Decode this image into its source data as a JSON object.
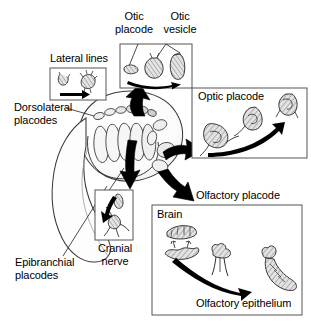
{
  "figure": {
    "background_color": "#ffffff",
    "stroke_color": "#000000",
    "arrow_color": "#000000",
    "panel_border_color": "#555555",
    "hatch_fill_color": "#d9d9d9"
  },
  "labels": {
    "otic_placode": "Otic\nplacode",
    "otic_vesicle": "Otic\nvesicle",
    "lateral_lines": "Lateral lines",
    "dorsolateral_placodes": "Dorsolateral\nplacodes",
    "epibranchial_placodes": "Epibranchial\nplacodes",
    "optic_placode": "Optic placode",
    "olfactory_placode": "Olfactory placode",
    "brain": "Brain",
    "olfactory_epithelium": "Olfactory epithelium",
    "cranial_nerve": "Cranial\nnerve"
  },
  "panels": [
    {
      "id": "lateral-lines-panel",
      "label": "Lateral lines",
      "label_position": "above",
      "x": 50,
      "y": 68,
      "width": 56,
      "height": 32,
      "stage_count": 2,
      "arrow": "straight-right"
    },
    {
      "id": "otic-panel",
      "label": "Otic placode / Otic vesicle",
      "label_position": "above",
      "x": 120,
      "y": 44,
      "width": 72,
      "height": 44,
      "stage_count": 3,
      "arrow": "curved-right"
    },
    {
      "id": "optic-panel",
      "label": "Optic placode",
      "label_position": "inside-top-left",
      "x": 192,
      "y": 88,
      "width": 115,
      "height": 70,
      "stage_count": 3,
      "arrow": "curved-up-right"
    },
    {
      "id": "cranial-nerve-panel",
      "label": "Cranial nerve",
      "label_position": "below",
      "x": 95,
      "y": 190,
      "width": 38,
      "height": 50,
      "stage_count": 2,
      "arrow": "curved-down"
    },
    {
      "id": "olfactory-panel",
      "label": "Brain / Olfactory epithelium",
      "label_position": "inside-top-left",
      "x": 152,
      "y": 205,
      "width": 150,
      "height": 110,
      "stage_count": 3,
      "arrow": "curved-down-right"
    }
  ],
  "embryo": {
    "name": "embryo head",
    "dorsolateral_placode_count": 6,
    "epibranchial_placode_count": 6
  },
  "flow_arrows": [
    {
      "id": "arrow-to-otic",
      "from": "embryo",
      "to": "otic-panel",
      "direction": "up"
    },
    {
      "id": "arrow-to-optic",
      "from": "embryo",
      "to": "optic-panel",
      "direction": "right"
    },
    {
      "id": "arrow-to-cranial-nerve",
      "from": "embryo",
      "to": "cranial-nerve-panel",
      "direction": "down"
    },
    {
      "id": "arrow-to-olfactory",
      "from": "embryo",
      "to": "olfactory-panel",
      "direction": "down-right"
    }
  ]
}
